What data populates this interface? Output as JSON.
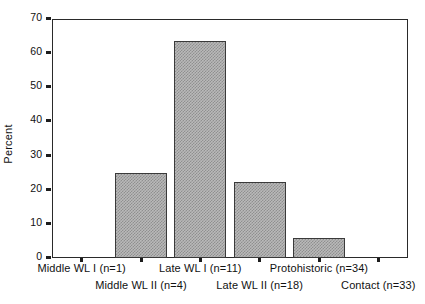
{
  "chart_data": {
    "type": "bar",
    "title": "",
    "xlabel": "",
    "ylabel": "Percent",
    "ylim": [
      0,
      70
    ],
    "yticks": [
      0,
      10,
      20,
      30,
      40,
      50,
      60,
      70
    ],
    "ytick_labels": [
      "0",
      "10",
      "20",
      "30",
      "40",
      "50",
      "60",
      "70"
    ],
    "grid": false,
    "legend": "none",
    "categories": [
      "Middle WL I (n=1)",
      "Middle WL II (n=4)",
      "Late WL I (n=11)",
      "Late WL II (n=18)",
      "Protohistoric (n=34)",
      "Contact (n=33)"
    ],
    "values": [
      0,
      25.0,
      63.6,
      22.2,
      5.9,
      0
    ],
    "bar_fill_color": "#b9b9b9",
    "bar_edge_color": "#3a3a3a",
    "axis_color": "#2a2a2a",
    "background_color": "#ffffff"
  },
  "axis": {
    "y_title": "Percent"
  },
  "x_labels_row1": [
    "Middle WL I (n=1)",
    "Late WL I (n=11)",
    "Protohistoric (n=34)"
  ],
  "x_labels_row2": [
    "Middle WL II (n=4)",
    "Late WL II (n=18)",
    "Contact (n=33)"
  ]
}
